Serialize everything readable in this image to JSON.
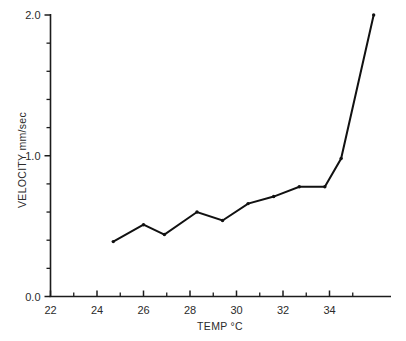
{
  "chart_data": {
    "type": "line",
    "title": "",
    "xlabel": "TEMP °C",
    "ylabel": "VELOCITY  mm/sec",
    "xlim": [
      22,
      35
    ],
    "ylim": [
      0.0,
      2.0
    ],
    "grid": false,
    "legend": null,
    "x_major_ticks": [
      22,
      24,
      26,
      28,
      30,
      32,
      34
    ],
    "x_major_tick_labels": [
      "22",
      "24",
      "26",
      "28",
      "30",
      "32",
      "34"
    ],
    "x_minor_ticks": [
      23,
      25,
      27,
      29,
      31,
      33,
      35
    ],
    "y_major_ticks": [
      0.0,
      1.0,
      2.0
    ],
    "y_major_tick_labels": [
      "0.0",
      "1.0",
      "2.0"
    ],
    "y_minor_ticks": [
      0.2,
      0.4,
      0.6,
      0.8,
      1.2,
      1.4,
      1.6,
      1.8
    ],
    "series": [
      {
        "name": "velocity",
        "color": "#111111",
        "marker": "dot",
        "x": [
          24.7,
          26.0,
          26.9,
          28.3,
          29.4,
          30.5,
          31.6,
          32.7,
          34.0,
          35.0,
          36.0
        ],
        "y": [
          0.39,
          0.51,
          0.44,
          0.6,
          0.54,
          0.66,
          0.71,
          0.78,
          0.78,
          0.98,
          2.0
        ]
      }
    ],
    "points": [
      {
        "temp": 24.7,
        "velocity": 0.39
      },
      {
        "temp": 26.0,
        "velocity": 0.51
      },
      {
        "temp": 26.9,
        "velocity": 0.44
      },
      {
        "temp": 28.3,
        "velocity": 0.6
      },
      {
        "temp": 29.4,
        "velocity": 0.54
      },
      {
        "temp": 30.5,
        "velocity": 0.66
      },
      {
        "temp": 31.6,
        "velocity": 0.71
      },
      {
        "temp": 32.7,
        "velocity": 0.78
      },
      {
        "temp": 33.8,
        "velocity": 0.78
      },
      {
        "temp": 34.5,
        "velocity": 0.98
      },
      {
        "temp": 35.9,
        "velocity": 2.0
      }
    ]
  }
}
